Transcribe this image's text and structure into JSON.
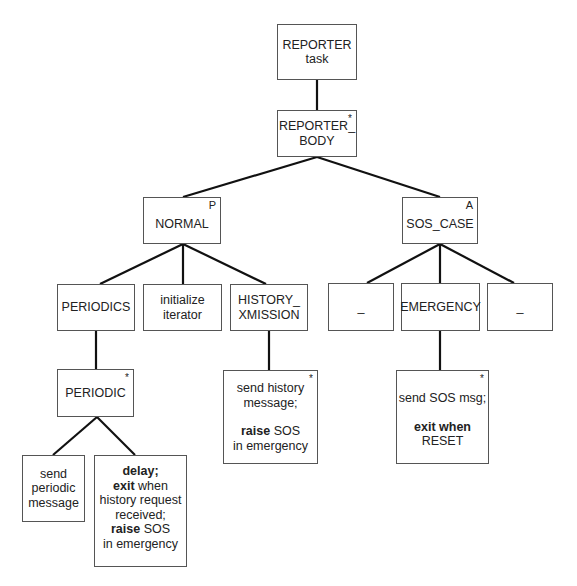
{
  "diagram": {
    "type": "jackson-structure-diagram",
    "nodes": {
      "reporter_task": {
        "lines": [
          "REPORTER",
          "task"
        ],
        "marker": ""
      },
      "reporter_body": {
        "lines": [
          "REPORTER_",
          "BODY"
        ],
        "marker": "*"
      },
      "normal": {
        "lines": [
          "NORMAL"
        ],
        "marker": "P"
      },
      "sos_case": {
        "lines": [
          "SOS_CASE"
        ],
        "marker": "A"
      },
      "periodics": {
        "lines": [
          "PERIODICS"
        ],
        "marker": ""
      },
      "initialize_iterator": {
        "lines": [
          "initialize",
          "iterator"
        ],
        "marker": ""
      },
      "history_xmission": {
        "lines": [
          "HISTORY_",
          "XMISSION"
        ],
        "marker": ""
      },
      "null_left": {
        "lines": [
          "_"
        ],
        "marker": ""
      },
      "emergency": {
        "lines": [
          "EMERGENCY"
        ],
        "marker": ""
      },
      "null_right": {
        "lines": [
          "_"
        ],
        "marker": ""
      },
      "periodic": {
        "lines": [
          "PERIODIC"
        ],
        "marker": "*"
      },
      "send_periodic_message": {
        "lines": [
          "send",
          "periodic",
          "message"
        ],
        "marker": ""
      },
      "delay_box": {
        "l1_bold": "delay;",
        "l2_bold": "exit",
        "l2_rest": " when",
        "l3": "history request",
        "l4": "received;",
        "l5_bold": "raise",
        "l5_rest": " SOS",
        "l6": "in emergency",
        "marker": ""
      },
      "send_history": {
        "l1": "send history",
        "l2": "message;",
        "l3_bold": "raise",
        "l3_rest": " SOS",
        "l4": "in emergency",
        "marker": "*"
      },
      "send_sos": {
        "l1": "send SOS msg;",
        "l2_bold": "exit when",
        "l3": "RESET",
        "marker": "*"
      }
    },
    "edges": [
      [
        "reporter_task",
        "reporter_body"
      ],
      [
        "reporter_body",
        "normal"
      ],
      [
        "reporter_body",
        "sos_case"
      ],
      [
        "normal",
        "periodics"
      ],
      [
        "normal",
        "initialize_iterator"
      ],
      [
        "normal",
        "history_xmission"
      ],
      [
        "sos_case",
        "null_left"
      ],
      [
        "sos_case",
        "emergency"
      ],
      [
        "sos_case",
        "null_right"
      ],
      [
        "periodics",
        "periodic"
      ],
      [
        "periodic",
        "send_periodic_message"
      ],
      [
        "periodic",
        "delay_box"
      ],
      [
        "history_xmission",
        "send_history"
      ],
      [
        "emergency",
        "send_sos"
      ]
    ]
  }
}
